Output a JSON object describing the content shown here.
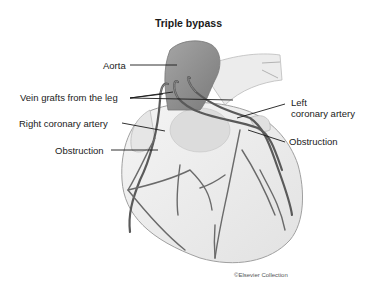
{
  "title": "Triple bypass",
  "labels": {
    "aorta": "Aorta",
    "vein_grafts": "Vein grafts from the leg",
    "left_coronary_line1": "Left",
    "left_coronary_line2": "coronary artery",
    "right_coronary": "Right coronary artery",
    "obstruction_left": "Obstruction",
    "obstruction_right": "Obstruction"
  },
  "credit": "©Elsevier Collection",
  "colors": {
    "background": "#ffffff",
    "heart_fill": "#eeeeee",
    "heart_outline": "#9a9a9a",
    "aorta_fill": "#8c8c8c",
    "vessel": "#6a6a6a",
    "leader_line": "#1a1a1a"
  }
}
